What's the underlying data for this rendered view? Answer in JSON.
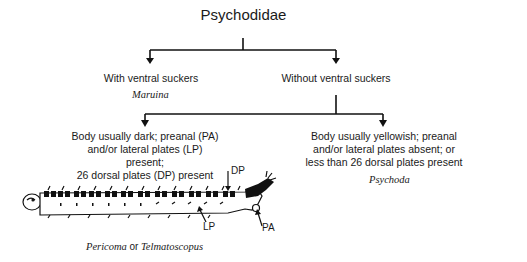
{
  "diagram": {
    "title": "Psychodidae",
    "level1": [
      {
        "label": "With ventral suckers",
        "genus": "Maruina"
      },
      {
        "label": "Without ventral suckers"
      }
    ],
    "level2": [
      {
        "lines": [
          "Body usually dark; preanal (PA)",
          "and/or lateral plates (LP) present;",
          "26 dorsal plates (DP) present"
        ],
        "genus_a": "Pericoma",
        "conjunction": "or",
        "genus_b": "Telmatoscopus"
      },
      {
        "lines": [
          "Body usually yellowish; preanal",
          "and/or lateral plates absent; or",
          "less than 26 dorsal plates present"
        ],
        "genus": "Psychoda"
      }
    ],
    "illustration": {
      "subject": "larva",
      "annotations": {
        "dp": "DP",
        "lp": "LP",
        "pa": "PA"
      }
    }
  }
}
